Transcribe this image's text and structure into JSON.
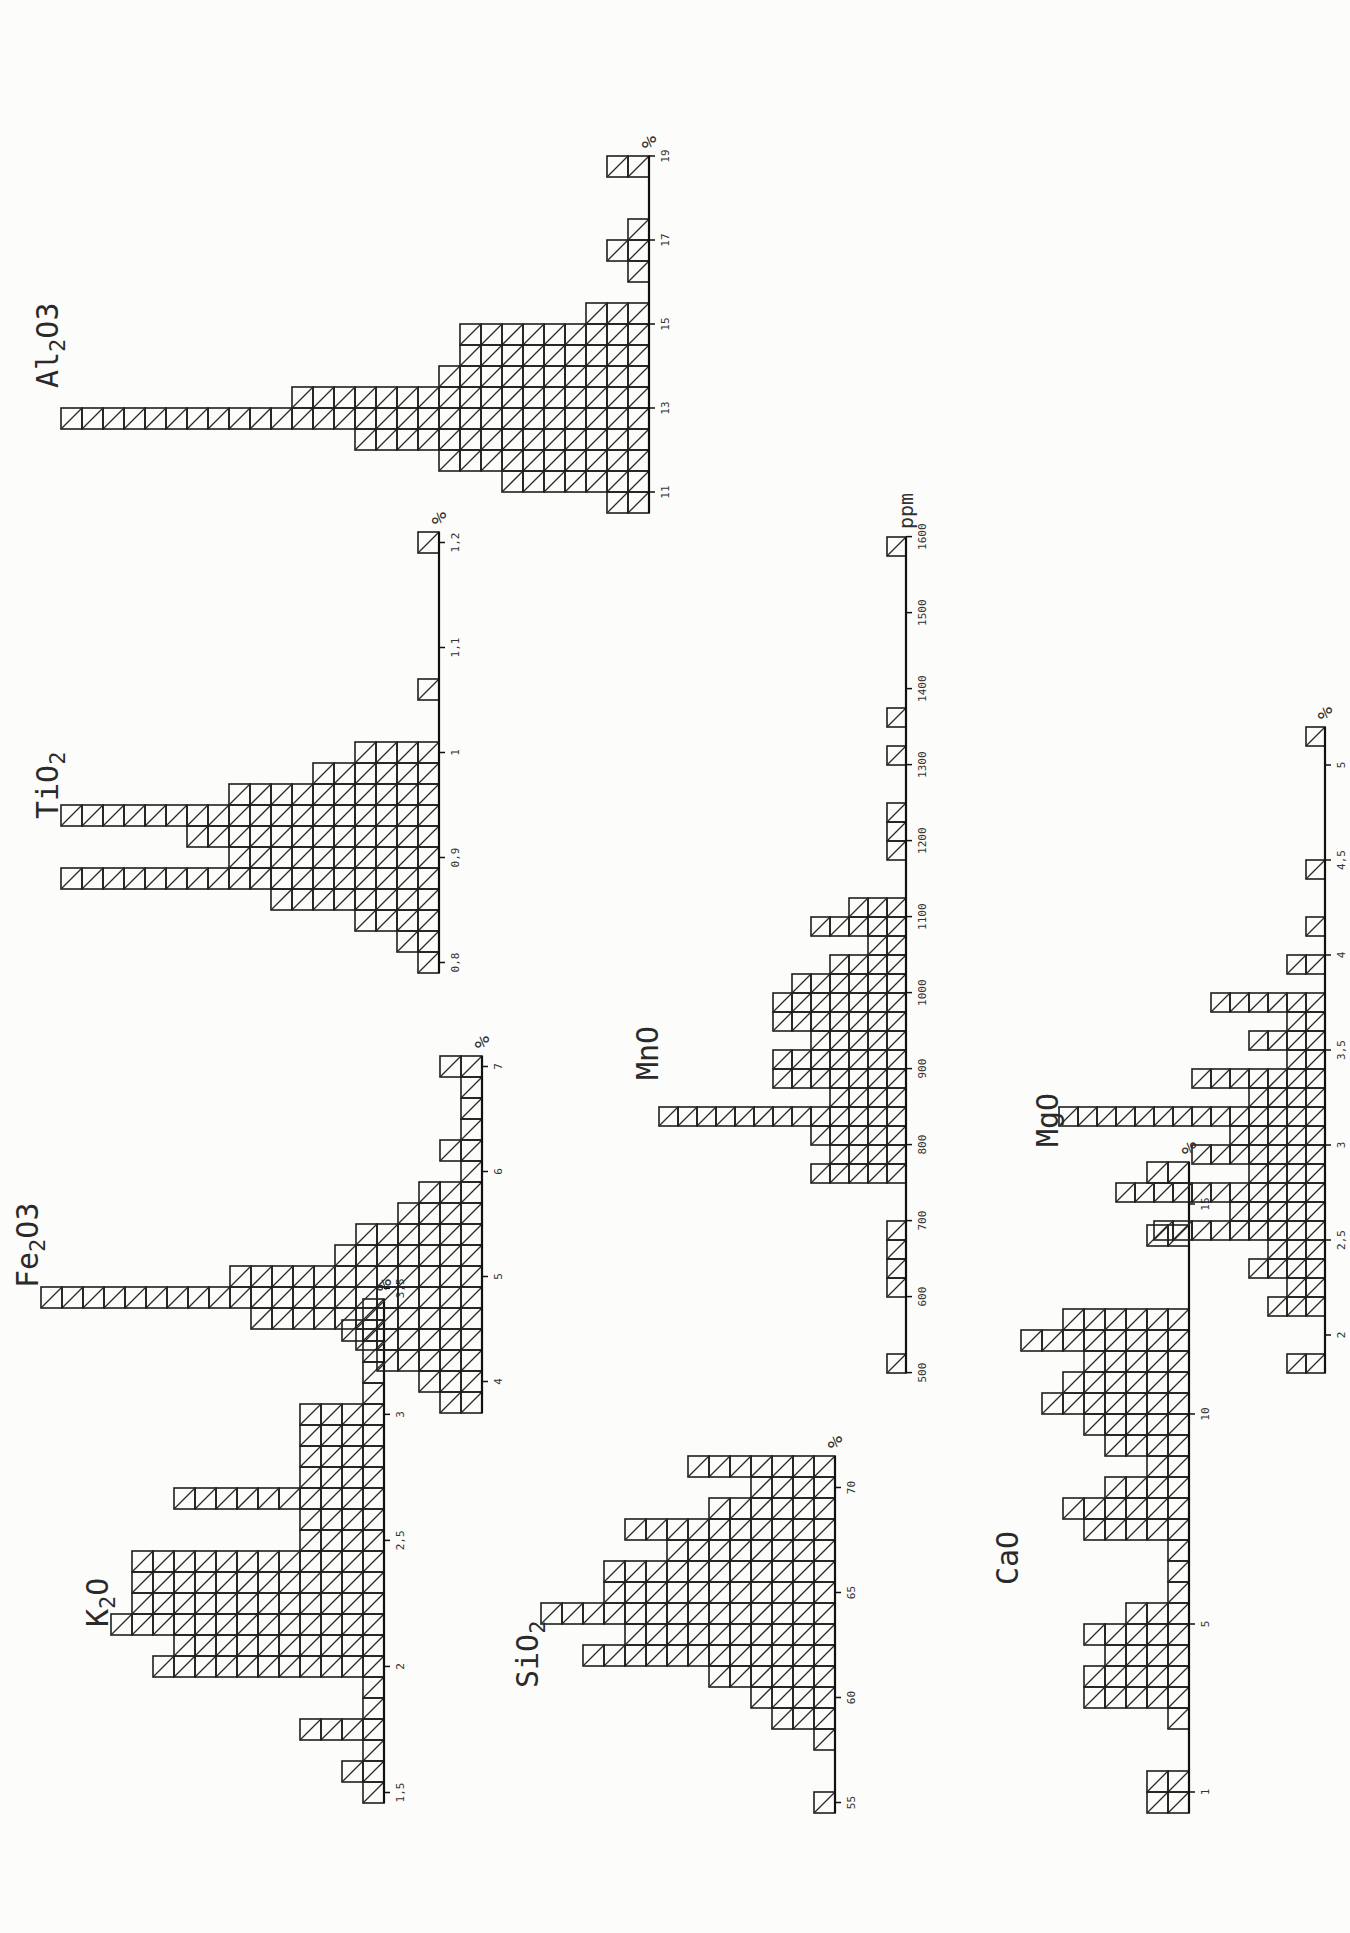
{
  "chart_data": [
    {
      "id": "k2o",
      "type": "bar",
      "title": "K2O",
      "title_main": "K",
      "title_sub": "2",
      "title_tail": "O",
      "unit": "%",
      "xlabel": "K2O (%)",
      "ylabel": "Number of samples",
      "tick_labels": [
        "1,5",
        "2",
        "2,5",
        "3",
        "3,5"
      ],
      "tick_values": [
        1.5,
        2.0,
        2.5,
        3.0,
        3.5
      ],
      "bin_width": 0.0833,
      "x": [
        1.5,
        1.58,
        1.67,
        1.75,
        1.83,
        1.92,
        2.0,
        2.08,
        2.17,
        2.25,
        2.33,
        2.42,
        2.5,
        2.58,
        2.67,
        2.75,
        2.83,
        2.92,
        3.0,
        3.08,
        3.17,
        3.25,
        3.33,
        3.42
      ],
      "values": [
        1,
        2,
        1,
        4,
        1,
        1,
        11,
        10,
        13,
        12,
        12,
        12,
        4,
        4,
        10,
        4,
        4,
        4,
        4,
        1,
        1,
        1,
        2,
        1
      ],
      "layout": {
        "left": 130,
        "top": 90,
        "cell": 21,
        "axis_min": 1.5,
        "axis_max": 3.5
      }
    },
    {
      "id": "fe2o3",
      "type": "bar",
      "title": "Fe2O3",
      "title_main": "Fe",
      "title_sub": "2",
      "title_tail": "O3",
      "unit": "%",
      "xlabel": "Fe2O3 (%)",
      "ylabel": "Number of samples",
      "tick_labels": [
        "4",
        "5",
        "6",
        "7"
      ],
      "tick_values": [
        4,
        5,
        6,
        7
      ],
      "bin_width": 0.2,
      "x": [
        3.8,
        4.0,
        4.2,
        4.4,
        4.6,
        4.8,
        5.0,
        5.2,
        5.4,
        5.6,
        5.8,
        6.0,
        6.2,
        6.4,
        6.6,
        6.8,
        7.0
      ],
      "values": [
        2,
        3,
        5,
        6,
        11,
        21,
        12,
        7,
        6,
        4,
        3,
        1,
        2,
        1,
        1,
        1,
        2
      ],
      "layout": {
        "left": 520,
        "top": 20,
        "cell": 21,
        "axis_min": 3.8,
        "axis_max": 7.2
      }
    },
    {
      "id": "tio2",
      "type": "bar",
      "title": "TiO2",
      "title_main": "TiO",
      "title_sub": "2",
      "title_tail": "",
      "unit": "%",
      "xlabel": "TiO2 (%)",
      "ylabel": "Number of samples",
      "tick_labels": [
        "0,8",
        "0,9",
        "1",
        "1,1",
        "1,2"
      ],
      "tick_values": [
        0.8,
        0.9,
        1.0,
        1.1,
        1.2
      ],
      "bin_width": 0.02,
      "x": [
        0.8,
        0.82,
        0.84,
        0.86,
        0.88,
        0.9,
        0.92,
        0.94,
        0.96,
        0.98,
        1.0,
        1.02,
        1.04,
        1.06,
        1.08,
        1.1,
        1.12,
        1.14,
        1.16,
        1.18,
        1.2
      ],
      "values": [
        1,
        2,
        4,
        8,
        18,
        10,
        12,
        18,
        10,
        6,
        4,
        0,
        0,
        1,
        0,
        0,
        0,
        0,
        0,
        0,
        1
      ],
      "layout": {
        "left": 960,
        "top": 40,
        "cell": 21,
        "axis_min": 0.79,
        "axis_max": 1.21
      }
    },
    {
      "id": "al2o3",
      "type": "bar",
      "title": "Al2O3",
      "title_main": "Al",
      "title_sub": "2",
      "title_tail": "O3",
      "unit": "%",
      "xlabel": "Al2O3 (%)",
      "ylabel": "Number of samples",
      "tick_labels": [
        "11",
        "13",
        "15",
        "17",
        "19"
      ],
      "tick_values": [
        11,
        13,
        15,
        17,
        19
      ],
      "bin_width": 0.5,
      "x": [
        10.75,
        11.25,
        11.75,
        12.25,
        12.75,
        13.25,
        13.75,
        14.25,
        14.75,
        15.25,
        15.75,
        16.25,
        16.75,
        17.25,
        17.75,
        18.25,
        18.75
      ],
      "values": [
        2,
        7,
        10,
        14,
        28,
        17,
        10,
        9,
        9,
        3,
        0,
        1,
        2,
        1,
        0,
        0,
        2
      ],
      "layout": {
        "left": 1420,
        "top": 40,
        "cell": 21,
        "axis_min": 10.6,
        "axis_max": 19.2
      }
    },
    {
      "id": "sio2",
      "type": "bar",
      "title": "SiO2",
      "title_main": "SiO",
      "title_sub": "2",
      "title_tail": "",
      "unit": "%",
      "xlabel": "SiO2 (%)",
      "ylabel": "Number of samples",
      "tick_labels": [
        "55",
        "60",
        "65",
        "70"
      ],
      "tick_values": [
        55,
        60,
        65,
        70
      ],
      "bin_width": 1,
      "x": [
        55,
        56,
        57,
        58,
        59,
        60,
        61,
        62,
        63,
        64,
        65,
        66,
        67,
        68,
        69,
        70,
        71
      ],
      "values": [
        1,
        0,
        0,
        1,
        3,
        4,
        6,
        12,
        10,
        14,
        11,
        11,
        8,
        10,
        6,
        4,
        7
      ],
      "layout": {
        "left": 120,
        "top": 520,
        "cell": 21,
        "axis_min": 54.5,
        "axis_max": 71.5
      }
    },
    {
      "id": "mno",
      "type": "bar",
      "title": "MnO",
      "title_main": "MnO",
      "title_sub": "",
      "title_tail": "",
      "unit": "ppm",
      "xlabel": "MnO (ppm)",
      "ylabel": "Number of samples",
      "tick_labels": [
        "500",
        "600",
        "700",
        "800",
        "900",
        "1000",
        "1100",
        "1200",
        "1300",
        "1400",
        "1500",
        "1600"
      ],
      "tick_values": [
        500,
        600,
        700,
        800,
        900,
        1000,
        1100,
        1200,
        1300,
        1400,
        1500,
        1600
      ],
      "bin_width": 25,
      "x": [
        512,
        537,
        562,
        587,
        612,
        637,
        662,
        687,
        712,
        737,
        762,
        787,
        812,
        837,
        862,
        887,
        912,
        937,
        962,
        987,
        1012,
        1037,
        1062,
        1087,
        1112,
        1137,
        1162,
        1187,
        1212,
        1237,
        1262,
        1287,
        1312,
        1337,
        1362,
        1387,
        1412,
        1437,
        1462,
        1487,
        1512,
        1537,
        1562,
        1587
      ],
      "values": [
        1,
        0,
        0,
        0,
        1,
        1,
        1,
        1,
        0,
        0,
        5,
        4,
        5,
        13,
        4,
        7,
        7,
        5,
        7,
        7,
        6,
        4,
        2,
        5,
        3,
        0,
        0,
        1,
        1,
        1,
        0,
        0,
        1,
        0,
        1,
        0,
        0,
        0,
        0,
        0,
        0,
        0,
        0,
        1
      ],
      "layout": {
        "left": 560,
        "top": 640,
        "cell": 19,
        "axis_min": 500,
        "axis_max": 1600
      }
    },
    {
      "id": "cao",
      "type": "bar",
      "title": "CaO",
      "title_main": "CaO",
      "title_sub": "",
      "title_tail": "",
      "unit": "%",
      "xlabel": "CaO (%)",
      "ylabel": "Number of samples",
      "tick_labels": [
        "1",
        "5",
        "10",
        "15"
      ],
      "tick_values": [
        1,
        5,
        10,
        15
      ],
      "bin_width": 0.5,
      "x": [
        0.75,
        1.25,
        1.75,
        2.25,
        2.75,
        3.25,
        3.75,
        4.25,
        4.75,
        5.25,
        5.75,
        6.25,
        6.75,
        7.25,
        7.75,
        8.25,
        8.75,
        9.25,
        9.75,
        10.25,
        10.75,
        11.25,
        11.5,
        11.75,
        12.25,
        12.75,
        13.25,
        13.75,
        14.25,
        14.75,
        15.25
      ],
      "values": [
        2,
        2,
        0,
        0,
        1,
        5,
        5,
        4,
        5,
        3,
        1,
        1,
        1,
        5,
        6,
        4,
        2,
        4,
        5,
        7,
        6,
        5,
        8,
        6,
        0,
        0,
        0,
        2,
        0,
        0,
        2
      ],
      "layout": {
        "left": 120,
        "top": 1000,
        "cell": 21,
        "axis_min": 0.5,
        "axis_max": 15.8
      }
    },
    {
      "id": "mgo",
      "type": "bar",
      "title": "MgO",
      "title_main": "MgO",
      "title_sub": "",
      "title_tail": "",
      "unit": "%",
      "xlabel": "MgO (%)",
      "ylabel": "Number of samples",
      "tick_labels": [
        "2",
        "2,5",
        "3",
        "3,5",
        "4",
        "4,5",
        "5"
      ],
      "tick_values": [
        2,
        2.5,
        3,
        3.5,
        4,
        4.5,
        5
      ],
      "bin_width": 0.1,
      "x": [
        1.85,
        1.95,
        2.05,
        2.15,
        2.25,
        2.35,
        2.45,
        2.55,
        2.65,
        2.75,
        2.85,
        2.95,
        3.05,
        3.15,
        3.25,
        3.35,
        3.45,
        3.55,
        3.65,
        3.75,
        3.85,
        3.95,
        4.05,
        4.15,
        4.25,
        4.35,
        4.45,
        4.55,
        4.65,
        4.75,
        4.85,
        4.95,
        5.05,
        5.15
      ],
      "values": [
        2,
        0,
        0,
        3,
        2,
        4,
        3,
        9,
        5,
        11,
        4,
        7,
        5,
        14,
        4,
        7,
        2,
        4,
        2,
        6,
        0,
        2,
        0,
        1,
        0,
        0,
        1,
        0,
        0,
        0,
        0,
        0,
        0,
        1
      ],
      "layout": {
        "left": 560,
        "top": 1040,
        "cell": 19,
        "axis_min": 1.8,
        "axis_max": 5.2
      }
    }
  ]
}
